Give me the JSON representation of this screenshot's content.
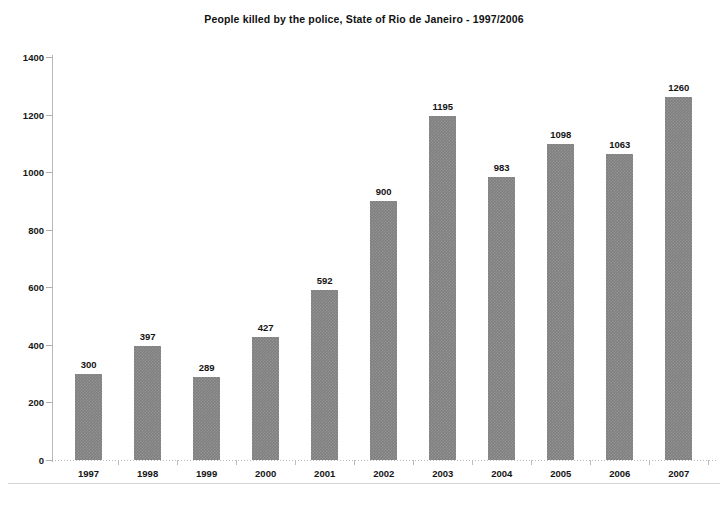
{
  "chart_data": {
    "type": "bar",
    "title": "People killed by the police, State of Rio de Janeiro - 1997/2006",
    "xlabel": "",
    "ylabel": "",
    "categories": [
      "1997",
      "1998",
      "1999",
      "2000",
      "2001",
      "2002",
      "2003",
      "2004",
      "2005",
      "2006",
      "2007"
    ],
    "values": [
      300,
      397,
      289,
      427,
      592,
      900,
      1195,
      983,
      1098,
      1063,
      1260
    ],
    "ylim": [
      0,
      1400
    ],
    "yticks": [
      0,
      200,
      400,
      600,
      800,
      1000,
      1200,
      1400
    ],
    "ytick_labels": [
      "0",
      "200",
      "400",
      "600",
      "800",
      "1000",
      "1200",
      "1400"
    ],
    "grid": false,
    "legend": false,
    "data_labels": [
      "300",
      "397",
      "289",
      "427",
      "592",
      "900",
      "1195",
      "983",
      "1098",
      "1063",
      "1260"
    ],
    "bar_color": "#808080",
    "axis_color": "#b8b8b8",
    "text_color": "#141414",
    "background": "#ffffff"
  }
}
